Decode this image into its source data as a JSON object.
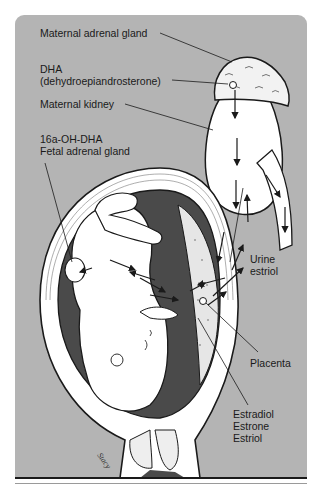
{
  "diagram": {
    "type": "anatomical-illustration",
    "colors": {
      "background_panel": "#b4b4b4",
      "outline": "#1a1a1a",
      "fill_light": "#ffffff",
      "amniotic_dark": "#4a4a4a"
    },
    "labels": {
      "maternal_adrenal_gland": "Maternal adrenal gland",
      "dha": "DHA",
      "dha_full": "(dehydroepiandrosterone)",
      "maternal_kidney": "Maternal kidney",
      "oh_dha": "16a-OH-DHA",
      "fetal_adrenal_gland": "Fetal adrenal gland",
      "urine": "Urine",
      "estriol": "estriol",
      "placenta": "Placenta",
      "estradiol": "Estradiol",
      "estrone": "Estrone",
      "estriol_product": "Estriol"
    },
    "signature": "Stacy"
  }
}
